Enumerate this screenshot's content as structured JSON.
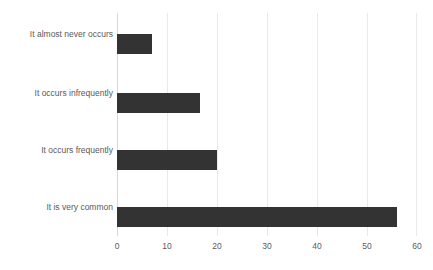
{
  "chart_data": {
    "type": "bar",
    "orientation": "horizontal",
    "title": "",
    "subtitle": "",
    "xlabel": "",
    "ylabel": "",
    "categories": [
      "It almost never occurs",
      "It occurs infrequently",
      "It occurs frequently",
      "It is very common"
    ],
    "values": [
      7,
      16.5,
      20,
      56
    ],
    "xlim": [
      0,
      60
    ],
    "xticks": [
      0,
      10,
      20,
      30,
      40,
      50,
      60
    ],
    "xtick_labels": [
      "0",
      "10",
      "20",
      "30",
      "40",
      "50",
      "60"
    ],
    "grid": true,
    "grid_axis": "x",
    "legend": false,
    "legend_position": "none",
    "bar_color": "#333333",
    "gridline_color": "#e9e9e9",
    "axis_color": "#d8d8d8",
    "background_color": "#ffffff",
    "tick_label_color": "#5a5a5a",
    "category_label_color": "#5a5a5a"
  }
}
